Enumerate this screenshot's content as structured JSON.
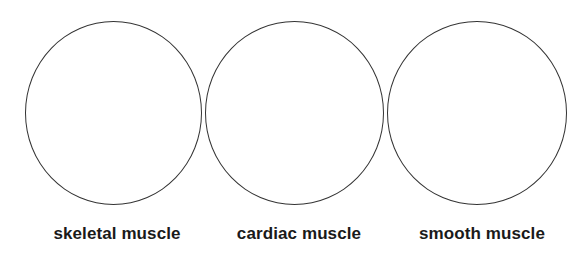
{
  "diagram": {
    "type": "blank-circle-labels",
    "colors": {
      "background": "#ffffff",
      "stroke": "#333333",
      "text": "#1a1a1a"
    },
    "items": [
      {
        "label": "skeletal muscle"
      },
      {
        "label": "cardiac muscle"
      },
      {
        "label": "smooth muscle"
      }
    ]
  }
}
